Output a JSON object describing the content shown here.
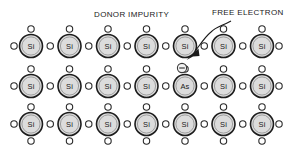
{
  "diagram": {
    "title_label": "DONOR IMPURITY",
    "callout_label": "FREE ELECTRON",
    "colors": {
      "atom_fill": "#dcdcdc",
      "atom_stroke": "#1c1c1c",
      "electron_fill": "#ffffff",
      "electron_stroke": "#2a2a2a",
      "text": "#1a1a1a",
      "background": "#ffffff"
    },
    "layout": {
      "columns": 7,
      "rows": 3,
      "atom_radius": 11.5,
      "electron_radius": 3.2,
      "column_spacing": 38.5,
      "first_column_x": 31,
      "row_y": [
        46,
        86,
        124
      ]
    },
    "lattice": {
      "rows": [
        {
          "row_index": 0,
          "atoms": [
            {
              "symbol": "Si"
            },
            {
              "symbol": "Si"
            },
            {
              "symbol": "Si"
            },
            {
              "symbol": "Si"
            },
            {
              "symbol": "Si"
            },
            {
              "symbol": "Si"
            },
            {
              "symbol": "Si"
            }
          ]
        },
        {
          "row_index": 1,
          "atoms": [
            {
              "symbol": "Si"
            },
            {
              "symbol": "Si"
            },
            {
              "symbol": "Si"
            },
            {
              "symbol": "Si"
            },
            {
              "symbol": "As"
            },
            {
              "symbol": "Si"
            },
            {
              "symbol": "Si"
            }
          ]
        },
        {
          "row_index": 2,
          "atoms": [
            {
              "symbol": "Si"
            },
            {
              "symbol": "Si"
            },
            {
              "symbol": "Si"
            },
            {
              "symbol": "Si"
            },
            {
              "symbol": "Si"
            },
            {
              "symbol": "Si"
            },
            {
              "symbol": "Si"
            }
          ]
        }
      ]
    },
    "free_electron": {
      "charge_symbol": "−",
      "x": 182,
      "y": 68
    }
  }
}
